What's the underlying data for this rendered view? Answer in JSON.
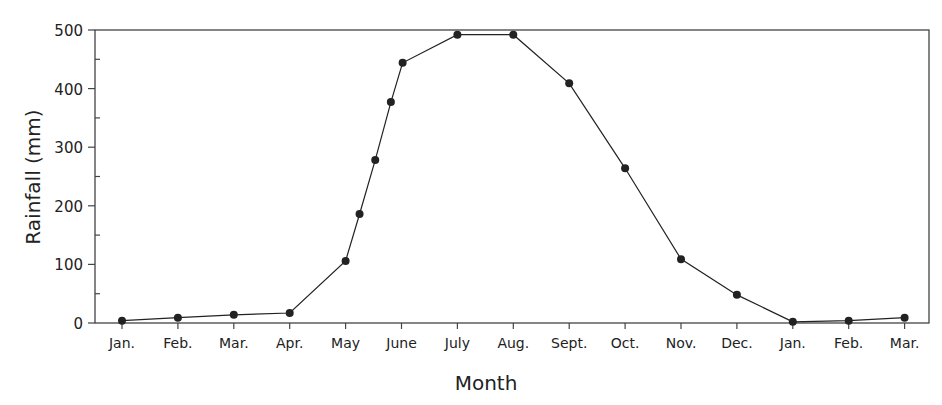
{
  "chart_data": {
    "type": "line",
    "title": "",
    "xlabel": "Month",
    "ylabel": "Rainfall (mm)",
    "ylim": [
      0,
      500
    ],
    "yticks": [
      0,
      100,
      200,
      300,
      400,
      500
    ],
    "y_minor_step": 50,
    "grid": false,
    "legend": null,
    "categories": [
      "Jan.",
      "Feb.",
      "Mar.",
      "Apr.",
      "May",
      "June",
      "July",
      "Aug.",
      "Sept.",
      "Oct.",
      "Nov.",
      "Dec.",
      "Jan.",
      "Feb.",
      "Mar."
    ],
    "series": [
      {
        "name": "Rainfall",
        "color": "#222222",
        "points": [
          {
            "x": 0,
            "y": 4
          },
          {
            "x": 1,
            "y": 9
          },
          {
            "x": 2,
            "y": 14
          },
          {
            "x": 3,
            "y": 17
          },
          {
            "x": 4,
            "y": 106
          },
          {
            "x": 4.25,
            "y": 186
          },
          {
            "x": 4.53,
            "y": 278
          },
          {
            "x": 4.81,
            "y": 377
          },
          {
            "x": 5.02,
            "y": 444
          },
          {
            "x": 6,
            "y": 492
          },
          {
            "x": 7,
            "y": 492
          },
          {
            "x": 8,
            "y": 409
          },
          {
            "x": 9,
            "y": 264
          },
          {
            "x": 10,
            "y": 109
          },
          {
            "x": 11,
            "y": 48
          },
          {
            "x": 12,
            "y": 2
          },
          {
            "x": 13,
            "y": 4
          },
          {
            "x": 14,
            "y": 9
          }
        ]
      }
    ]
  }
}
